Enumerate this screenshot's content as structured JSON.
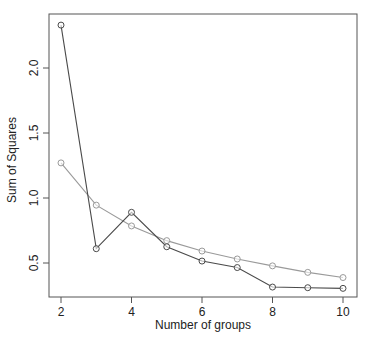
{
  "chart_data": {
    "type": "line",
    "title": "",
    "xlabel": "Number of groups",
    "ylabel": "Sum of Squares",
    "x": [
      2,
      3,
      4,
      5,
      6,
      7,
      8,
      9,
      10
    ],
    "xticks": [
      "2",
      "4",
      "6",
      "8",
      "10"
    ],
    "yticks": [
      "0.5",
      "1.0",
      "1.5",
      "2.0"
    ],
    "xlim": [
      1.8,
      10.4
    ],
    "ylim": [
      0.22,
      2.42
    ],
    "grid": false,
    "legend": null,
    "series": [
      {
        "name": "series-dark",
        "color": "#4a4a4a",
        "marker": "open-circle",
        "values": [
          2.33,
          0.61,
          0.89,
          0.625,
          0.515,
          0.465,
          0.315,
          0.31,
          0.305
        ]
      },
      {
        "name": "series-light",
        "color": "#9a9a9a",
        "marker": "open-circle",
        "values": [
          1.27,
          0.945,
          0.785,
          0.672,
          0.592,
          0.531,
          0.478,
          0.428,
          0.388
        ]
      }
    ]
  },
  "colors": {
    "frame": "#555555",
    "background": "#ffffff"
  }
}
